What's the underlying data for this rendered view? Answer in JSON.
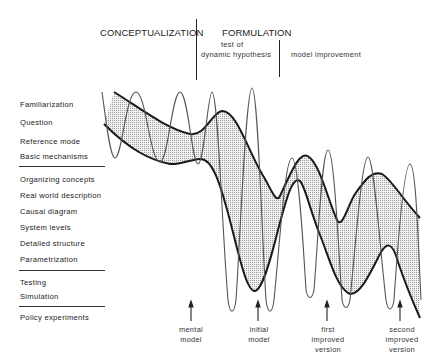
{
  "phases": {
    "conceptualization": "CONCEPTUALIZATION",
    "formulation": "FORMULATION",
    "test_of": "test of",
    "dynamic_hypothesis": "dynamic hypothesis",
    "model_improvement": "model improvement"
  },
  "steps": [
    {
      "label": "Familiarization"
    },
    {
      "label": "Question"
    },
    {
      "label": "Reference mode"
    },
    {
      "label": "Basic mechanisms"
    },
    {
      "label": "Organizing concepts"
    },
    {
      "label": "Real world description"
    },
    {
      "label": "Causal diagram"
    },
    {
      "label": "System levels"
    },
    {
      "label": "Detailed structure"
    },
    {
      "label": "Parametrization"
    },
    {
      "label": "Testing"
    },
    {
      "label": "Simulation"
    },
    {
      "label": "Policy experiments"
    }
  ],
  "milestones": [
    {
      "line1": "mental",
      "line2": "model",
      "line3": ""
    },
    {
      "line1": "initial",
      "line2": "model",
      "line3": ""
    },
    {
      "line1": "first",
      "line2": "improved",
      "line3": "version"
    },
    {
      "line1": "second",
      "line2": "improved",
      "line3": "version"
    }
  ],
  "colors": {
    "ink": "#1a1a1a",
    "band_fill": "#d9d9d9",
    "thin_line": "#555555"
  }
}
